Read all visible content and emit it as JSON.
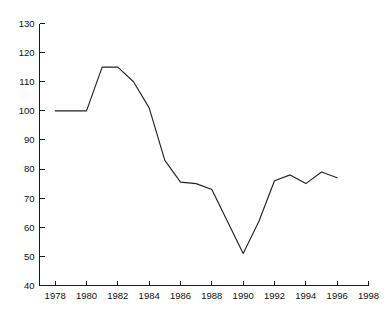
{
  "chart_data": {
    "type": "line",
    "title": "",
    "subtitle": "",
    "xlabel": "",
    "ylabel": "",
    "xlim": [
      1977,
      1998
    ],
    "ylim": [
      40,
      130
    ],
    "grid": false,
    "legend": null,
    "legend_position": "none",
    "line_color": "#232323",
    "axis_color": "#1a1a1a",
    "background_color": "#ffffff",
    "x_ticks": [
      1978,
      1980,
      1982,
      1984,
      1986,
      1988,
      1990,
      1992,
      1994,
      1996,
      1998
    ],
    "x_tick_labels": [
      "1978",
      "1980",
      "1982",
      "1984",
      "1986",
      "1988",
      "1990",
      "1992",
      "1994",
      "1996",
      "1998"
    ],
    "y_ticks": [
      40,
      50,
      60,
      70,
      80,
      90,
      100,
      110,
      120,
      130
    ],
    "y_tick_labels": [
      "40",
      "50",
      "60",
      "70",
      "80",
      "90",
      "100",
      "110",
      "120",
      "130"
    ],
    "series": [
      {
        "name": "series-1",
        "x": [
          1978,
          1979,
          1980,
          1981,
          1982,
          1983,
          1984,
          1985,
          1986,
          1987,
          1988,
          1989,
          1990,
          1991,
          1992,
          1993,
          1994,
          1995,
          1996
        ],
        "values": [
          100,
          100,
          100,
          115,
          115,
          110,
          101,
          83,
          75.5,
          75,
          73,
          62,
          51,
          62,
          76,
          78,
          75,
          79,
          77
        ]
      }
    ]
  }
}
